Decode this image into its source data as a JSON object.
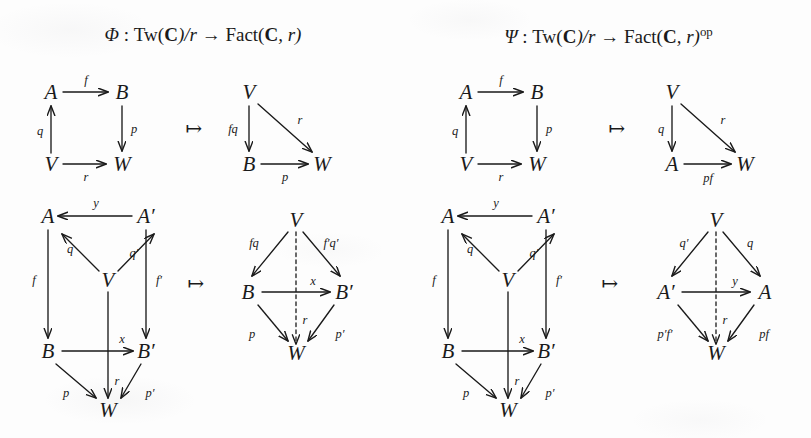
{
  "headers": [
    {
      "name": "phi-header",
      "prefix": "Φ",
      "sep": " : ",
      "source": "Tw(",
      "source_bold": "C",
      "source_rest": ")/r",
      "arrow": " → ",
      "target": "Fact(",
      "target_bold": "C",
      "target_rest": ", r)",
      "op": "",
      "full": "Φ : Tw(C)/r → Fact(C, r)"
    },
    {
      "name": "psi-header",
      "prefix": "Ψ",
      "sep": " : ",
      "source": "Tw(",
      "source_bold": "C",
      "source_rest": ")/r",
      "arrow": " → ",
      "target": "Fact(",
      "target_bold": "C",
      "target_rest": ", r)",
      "op": "op",
      "full": "Ψ : Tw(C)/r → Fact(C, r)op"
    }
  ],
  "mapsto_symbol": "↦",
  "diagrams": {
    "phi_top_source": {
      "objects": {
        "a": "A",
        "b": "B",
        "v": "V",
        "w": "W"
      },
      "labels": {
        "f": "f",
        "q": "q",
        "p": "p",
        "r": "r"
      }
    },
    "phi_top_target": {
      "objects": {
        "v": "V",
        "b": "B",
        "w": "W"
      },
      "labels": {
        "fq": "fq",
        "r": "r",
        "p": "p"
      }
    },
    "psi_top_source": {
      "objects": {
        "a": "A",
        "b": "B",
        "v": "V",
        "w": "W"
      },
      "labels": {
        "f": "f",
        "q": "q",
        "p": "p",
        "r": "r"
      }
    },
    "psi_top_target": {
      "objects": {
        "v": "V",
        "a": "A",
        "w": "W"
      },
      "labels": {
        "q": "q",
        "r": "r",
        "pf": "pf"
      }
    },
    "phi_bot_source": {
      "objects": {
        "a": "A",
        "ap": "A′",
        "v": "V",
        "b": "B",
        "bp": "B′",
        "w": "W"
      },
      "labels": {
        "y": "y",
        "q": "q",
        "qp": "q′",
        "f": "f",
        "fp": "f′",
        "x": "x",
        "p": "p",
        "r": "r",
        "pp": "p′"
      }
    },
    "phi_bot_target": {
      "objects": {
        "v": "V",
        "b": "B",
        "bp": "B′",
        "w": "W"
      },
      "labels": {
        "fq": "fq",
        "fpqp": "f′q′",
        "x": "x",
        "p": "p",
        "r": "r",
        "pp": "p′"
      }
    },
    "psi_bot_source": {
      "objects": {
        "a": "A",
        "ap": "A′",
        "v": "V",
        "b": "B",
        "bp": "B′",
        "w": "W"
      },
      "labels": {
        "y": "y",
        "q": "q",
        "qp": "q′",
        "f": "f",
        "fp": "f′",
        "x": "x",
        "p": "p",
        "r": "r",
        "pp": "p′"
      }
    },
    "psi_bot_target": {
      "objects": {
        "v": "V",
        "ap": "A′",
        "a": "A",
        "w": "W"
      },
      "labels": {
        "qp": "q′",
        "q": "q",
        "y": "y",
        "r": "r",
        "ppfp": "p′f′",
        "pf": "pf"
      }
    }
  },
  "colors": {
    "ink": "#1a1a1a",
    "paper": "#fdfdfd"
  }
}
